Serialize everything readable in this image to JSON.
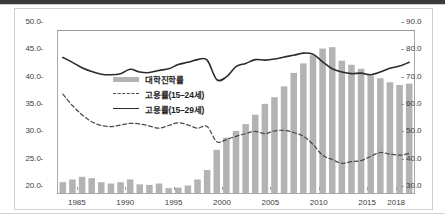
{
  "chart_data": {
    "type": "bar",
    "title": "",
    "subtitle": "",
    "xlabel": "",
    "ylabel": "",
    "y2label": "",
    "grid": false,
    "legend_position": "inside-upper-left",
    "ylim": [
      20.0,
      50.0
    ],
    "y2lim": [
      30.0,
      90.0
    ],
    "xlim": [
      1982,
      2018
    ],
    "ytick_labels": [
      "50.0",
      "45.0",
      "40.0",
      "35.0",
      "30.0",
      "25.0",
      "20.0"
    ],
    "ytick_values": [
      50.0,
      45.0,
      40.0,
      35.0,
      30.0,
      25.0,
      20.0
    ],
    "y2tick_labels": [
      "90.0",
      "80.0",
      "70.0",
      "60.0",
      "50.0",
      "40.0",
      "30.0"
    ],
    "y2tick_values": [
      90.0,
      80.0,
      70.0,
      60.0,
      50.0,
      40.0,
      30.0
    ],
    "xtick_labels": [
      "1985",
      "1990",
      "1995",
      "2000",
      "2005",
      "2010",
      "2015",
      "2018"
    ],
    "xtick_values": [
      1985,
      1990,
      1995,
      2000,
      2005,
      2010,
      2015,
      2018
    ],
    "x": [
      1982,
      1983,
      1984,
      1985,
      1986,
      1987,
      1988,
      1989,
      1990,
      1991,
      1992,
      1993,
      1994,
      1995,
      1996,
      1997,
      1998,
      1999,
      2000,
      2001,
      2002,
      2003,
      2004,
      2005,
      2006,
      2007,
      2008,
      2009,
      2010,
      2011,
      2012,
      2013,
      2014,
      2015,
      2016,
      2017,
      2018
    ],
    "series": [
      {
        "name": "대학진학률",
        "type": "bar",
        "axis": "right",
        "color": "#b3b3b3",
        "values": [
          34.0,
          35.0,
          36.0,
          35.5,
          34.0,
          33.5,
          34.0,
          35.0,
          33.2,
          33.0,
          33.5,
          31.8,
          32.0,
          32.8,
          35.0,
          38.5,
          46.0,
          50.5,
          53.0,
          55.5,
          59.0,
          63.0,
          65.5,
          69.5,
          74.5,
          78.0,
          81.0,
          83.5,
          84.0,
          79.0,
          77.5,
          76.0,
          73.5,
          72.5,
          71.0,
          70.0,
          70.5
        ]
      },
      {
        "name": "고용률(15–24세)",
        "type": "line-dashed",
        "axis": "left",
        "color": "#4a4a4a",
        "values": [
          38.3,
          36.2,
          34.5,
          33.2,
          32.5,
          32.3,
          32.6,
          32.9,
          32.8,
          32.4,
          32.0,
          32.5,
          33.0,
          32.6,
          32.0,
          32.3,
          29.5,
          29.9,
          30.5,
          31.0,
          31.4,
          31.0,
          31.5,
          31.6,
          31.2,
          30.5,
          29.0,
          27.0,
          26.2,
          25.5,
          25.8,
          26.0,
          26.8,
          27.5,
          27.2,
          27.0,
          27.3
        ]
      },
      {
        "name": "고용률(15–29세)",
        "type": "line-solid",
        "axis": "left",
        "color": "#2b2b2b",
        "values": [
          45.1,
          44.2,
          43.2,
          42.5,
          42.0,
          41.9,
          42.1,
          42.9,
          42.4,
          42.3,
          42.7,
          43.0,
          43.8,
          44.2,
          44.7,
          44.6,
          41.0,
          41.5,
          43.4,
          44.0,
          44.7,
          44.6,
          44.8,
          45.2,
          45.5,
          45.9,
          45.7,
          44.3,
          43.0,
          42.4,
          42.1,
          42.2,
          41.9,
          42.4,
          43.1,
          43.5,
          44.2
        ]
      }
    ]
  }
}
